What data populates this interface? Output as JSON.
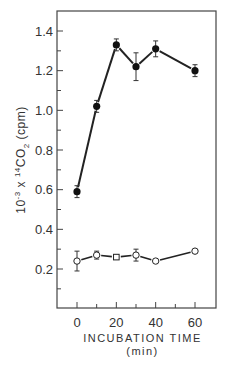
{
  "chart_data": {
    "type": "line",
    "title": "",
    "xlabel": "INCUBATION TIME",
    "xlabel_unit": "(min)",
    "ylabel": "10⁻³ x ¹⁴CO₂ (cpm)",
    "ylabel_parts": {
      "prefix": "10",
      "exp": "-3",
      "mid": " x ",
      "iso": "14",
      "co": "CO",
      "sub": "2",
      "unit": " (cpm)"
    },
    "xlim": [
      -7,
      70
    ],
    "ylim": [
      0,
      1.5
    ],
    "x_ticks": [
      0,
      20,
      40,
      60
    ],
    "x_minor_ticks": [
      10,
      30,
      50
    ],
    "y_ticks": [
      0.2,
      0.4,
      0.6,
      0.8,
      1.0,
      1.2,
      1.4
    ],
    "y_tick_labels": [
      "0.2",
      "0.4",
      "0.6",
      "0.8",
      "1.0",
      "1.2",
      "1.4"
    ],
    "y_minor_ticks": [
      0.1,
      0.3,
      0.5,
      0.7,
      0.9,
      1.1,
      1.3
    ],
    "grid": false,
    "series": [
      {
        "name": "filled circles",
        "marker": "filled-circle",
        "x": [
          0,
          10,
          20,
          30,
          40,
          60
        ],
        "y": [
          0.59,
          1.02,
          1.33,
          1.22,
          1.31,
          1.2
        ],
        "err": [
          0.03,
          0.03,
          0.03,
          0.07,
          0.04,
          0.03
        ]
      },
      {
        "name": "open circles",
        "marker": "open-circle",
        "x": [
          0,
          10,
          20,
          30,
          40,
          60
        ],
        "y": [
          0.24,
          0.27,
          0.26,
          0.27,
          0.24,
          0.29
        ],
        "err": [
          0.05,
          0.02,
          0.01,
          0.03,
          0.0,
          0.0
        ]
      }
    ]
  }
}
